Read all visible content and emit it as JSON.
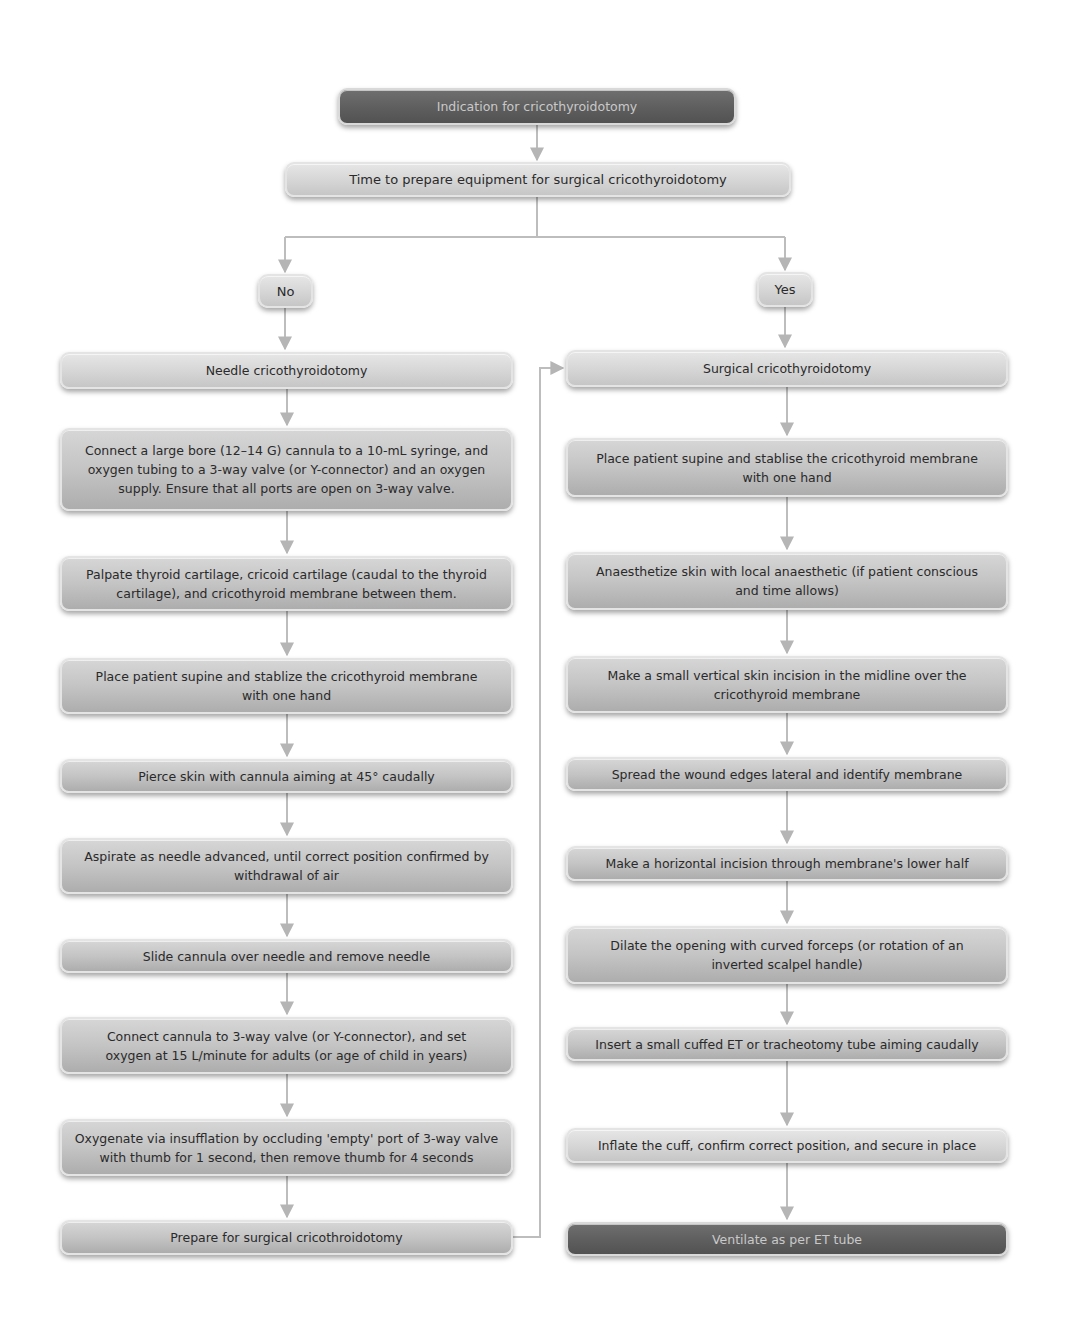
{
  "diagram": {
    "start": "Indication for cricothyroidotomy",
    "decision": "Time to prepare equipment for surgical cricothyroidotomy",
    "branch_no": "No",
    "branch_yes": "Yes",
    "no_branch_steps": [
      "Needle cricothyroidotomy",
      "Connect a large bore (12–14 G) cannula to a 10-mL syringe, and oxygen tubing to a 3-way valve (or Y-connector) and an oxygen supply. Ensure that all ports are open on 3-way valve.",
      "Palpate thyroid cartilage, cricoid cartilage (caudal to the thyroid cartilage), and cricothyroid membrane between them.",
      "Place patient supine and stablize the cricothyroid membrane with one hand",
      "Pierce skin with cannula aiming at 45° caudally",
      "Aspirate as needle advanced, until correct position confirmed by withdrawal of air",
      "Slide cannula over needle and remove needle",
      "Connect cannula to 3-way valve (or Y-connector), and set oxygen at 15 L/minute for adults (or age of child in years)",
      "Oxygenate via insufflation by occluding 'empty' port of 3-way valve with thumb for 1 second, then remove thumb for 4 seconds",
      "Prepare for surgical cricothroidotomy"
    ],
    "yes_branch_steps": [
      "Surgical cricothyroidotomy",
      "Place patient supine and stablise the cricothyroid membrane with one hand",
      "Anaesthetize skin with local anaesthetic (if patient conscious and time allows)",
      "Make a small vertical skin incision in the midline over the cricothyroid membrane",
      "Spread the wound edges lateral and identify membrane",
      "Make a horizontal incision through membrane's lower half",
      "Dilate the opening with curved forceps (or rotation of an inverted scalpel handle)",
      "Insert a small cuffed ET or tracheotomy tube aiming caudally",
      "Inflate the cuff, confirm correct position, and secure in place",
      "Ventilate as per ET tube"
    ],
    "colors": {
      "terminal_box": "#5e5e5e",
      "terminal_text": "#c9c9c9",
      "step_box": "#c4c4c4",
      "step_text": "#2a2a2a",
      "connector": "#b8b8b8"
    }
  }
}
